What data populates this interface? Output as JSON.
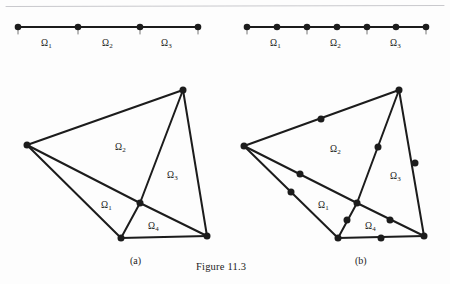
{
  "figure": {
    "caption": "Figure 11.3",
    "caption_pos": {
      "x": 196,
      "y": 262
    },
    "background_color": "#fdfdfd",
    "ink_color": "#1c1c1c",
    "rule_color": "#c9c9cd",
    "top_rule": {
      "x1": 6,
      "y1": 6.5,
      "x2": 444,
      "y2": 5.5
    },
    "panels": [
      {
        "id": "a",
        "label": "(a)",
        "x": 130,
        "y": 256
      },
      {
        "id": "b",
        "label": "(b)",
        "x": 355,
        "y": 256
      }
    ]
  },
  "line_mesh_linear": {
    "name": "1d-mesh-linear",
    "nodes": [
      {
        "x": 18,
        "y": 27
      },
      {
        "x": 78,
        "y": 27
      },
      {
        "x": 140,
        "y": 27
      },
      {
        "x": 198,
        "y": 27
      }
    ],
    "node_radius": 3.3,
    "segments": [
      {
        "x1": 18,
        "y1": 27,
        "x2": 78,
        "y2": 27
      },
      {
        "x1": 78,
        "y1": 27,
        "x2": 140,
        "y2": 27
      },
      {
        "x1": 140,
        "y1": 27,
        "x2": 198,
        "y2": 27
      }
    ],
    "ticks": [
      {
        "x": 18,
        "y1": 29,
        "y2": 34
      },
      {
        "x": 78,
        "y1": 29,
        "y2": 34
      },
      {
        "x": 140,
        "y1": 29,
        "y2": 34
      },
      {
        "x": 198,
        "y1": 29,
        "y2": 34
      }
    ],
    "labels": [
      {
        "symbol": "Ω",
        "sub": "1",
        "x": 41,
        "y": 39
      },
      {
        "symbol": "Ω",
        "sub": "2",
        "x": 102,
        "y": 39
      },
      {
        "symbol": "Ω",
        "sub": "3",
        "x": 161,
        "y": 39
      }
    ]
  },
  "line_mesh_quadratic": {
    "name": "1d-mesh-quadratic",
    "nodes": [
      {
        "x": 247,
        "y": 27
      },
      {
        "x": 277,
        "y": 27
      },
      {
        "x": 307,
        "y": 27
      },
      {
        "x": 337,
        "y": 27
      },
      {
        "x": 367,
        "y": 27
      },
      {
        "x": 396,
        "y": 27
      },
      {
        "x": 426,
        "y": 27
      }
    ],
    "node_radius": 3.3,
    "segments": [
      {
        "x1": 247,
        "y1": 27,
        "x2": 426,
        "y2": 27
      }
    ],
    "ticks": [
      {
        "x": 247,
        "y1": 29,
        "y2": 34
      },
      {
        "x": 307,
        "y1": 29,
        "y2": 34
      },
      {
        "x": 367,
        "y1": 29,
        "y2": 34
      },
      {
        "x": 426,
        "y1": 29,
        "y2": 34
      }
    ],
    "labels": [
      {
        "symbol": "Ω",
        "sub": "1",
        "x": 270,
        "y": 39
      },
      {
        "symbol": "Ω",
        "sub": "2",
        "x": 330,
        "y": 39
      },
      {
        "symbol": "Ω",
        "sub": "3",
        "x": 390,
        "y": 39
      }
    ]
  },
  "tri_mesh_linear": {
    "name": "2d-mesh-linear",
    "vertices": {
      "left": {
        "x": 27,
        "y": 145
      },
      "top": {
        "x": 183,
        "y": 90
      },
      "center": {
        "x": 140,
        "y": 203
      },
      "bottom": {
        "x": 121,
        "y": 238
      },
      "right": {
        "x": 207,
        "y": 236
      }
    },
    "edges": [
      {
        "from": "left",
        "to": "top"
      },
      {
        "from": "left",
        "to": "center"
      },
      {
        "from": "left",
        "to": "bottom"
      },
      {
        "from": "top",
        "to": "center"
      },
      {
        "from": "top",
        "to": "right"
      },
      {
        "from": "center",
        "to": "bottom"
      },
      {
        "from": "center",
        "to": "right"
      },
      {
        "from": "bottom",
        "to": "right"
      }
    ],
    "node_radius": 3.5,
    "labels": [
      {
        "symbol": "Ω",
        "sub": "1",
        "x": 101,
        "y": 201
      },
      {
        "symbol": "Ω",
        "sub": "2",
        "x": 115,
        "y": 143
      },
      {
        "symbol": "Ω",
        "sub": "3",
        "x": 167,
        "y": 171
      },
      {
        "symbol": "Ω",
        "sub": "4",
        "x": 148,
        "y": 222
      }
    ]
  },
  "tri_mesh_quadratic": {
    "name": "2d-mesh-quadratic",
    "vertices": {
      "left": {
        "x": 244,
        "y": 146
      },
      "top": {
        "x": 399,
        "y": 90
      },
      "center": {
        "x": 357,
        "y": 203
      },
      "bottom": {
        "x": 338,
        "y": 238
      },
      "right": {
        "x": 424,
        "y": 236
      }
    },
    "edges": [
      {
        "from": "left",
        "to": "top"
      },
      {
        "from": "left",
        "to": "center"
      },
      {
        "from": "left",
        "to": "bottom"
      },
      {
        "from": "top",
        "to": "center"
      },
      {
        "from": "top",
        "to": "right"
      },
      {
        "from": "center",
        "to": "bottom"
      },
      {
        "from": "center",
        "to": "right"
      },
      {
        "from": "bottom",
        "to": "right"
      }
    ],
    "midside_nodes": [
      {
        "x": 321,
        "y": 119
      },
      {
        "x": 300,
        "y": 174
      },
      {
        "x": 291,
        "y": 192
      },
      {
        "x": 378,
        "y": 147
      },
      {
        "x": 415,
        "y": 163
      },
      {
        "x": 347,
        "y": 220
      },
      {
        "x": 390,
        "y": 220
      },
      {
        "x": 381,
        "y": 238
      }
    ],
    "node_radius": 3.5,
    "labels": [
      {
        "symbol": "Ω",
        "sub": "1",
        "x": 318,
        "y": 201
      },
      {
        "symbol": "Ω",
        "sub": "2",
        "x": 330,
        "y": 145
      },
      {
        "symbol": "Ω",
        "sub": "3",
        "x": 390,
        "y": 172
      },
      {
        "symbol": "Ω",
        "sub": "4",
        "x": 365,
        "y": 222
      }
    ]
  }
}
